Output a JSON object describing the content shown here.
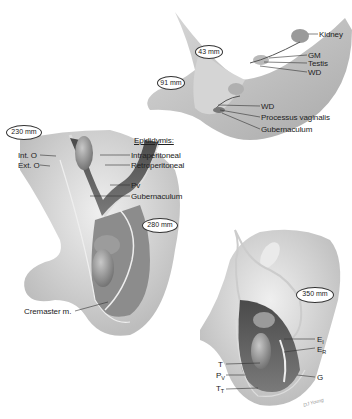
{
  "figure": {
    "stages": [
      {
        "id": "stage-43",
        "label": "43 mm"
      },
      {
        "id": "stage-91",
        "label": "91 mm"
      },
      {
        "id": "stage-230",
        "label": "230 mm"
      },
      {
        "id": "stage-280",
        "label": "280 mm"
      },
      {
        "id": "stage-350",
        "label": "350 mm"
      }
    ],
    "labels_top": {
      "kidney": "Kidney",
      "gm": "GM",
      "testis": "Testis",
      "wd1": "WD",
      "wd2": "WD",
      "processus": "Processus vaginalis",
      "gubernaculum": "Gubernaculum"
    },
    "labels_left": {
      "int_o": "Int. O",
      "ext_o": "Ext. O",
      "epididymis": "Epididymis:",
      "intraperitoneal": "Intraperitoneal",
      "retroperitoneal": "Retroperitoneal",
      "pv": "Pv",
      "gubernaculum": "Gubernaculum",
      "cremaster": "Cremaster m."
    },
    "labels_right": {
      "ei": "E",
      "ei_sub": "I",
      "er": "E",
      "er_sub": "R",
      "t": "T",
      "pv": "P",
      "pv_sub": "V",
      "tt": "T",
      "tt_sub": "T",
      "g": "G"
    },
    "signature": "DJ Young"
  }
}
